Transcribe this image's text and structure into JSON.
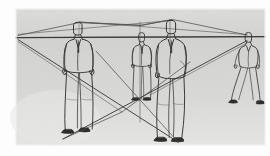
{
  "figure": {
    "type": "perspective-construction-sketch",
    "medium": "pencil line drawing on gray ground",
    "canvas": {
      "width": 270,
      "height": 156
    },
    "colors": {
      "page_background": "#fdfdfd",
      "ground_plane": "#d6d6d4",
      "ground_plane_light": "#e3e3e1",
      "ink": "#3b3b3b",
      "ink_light": "#6a6a6a",
      "shoe_fill": "#2e2e2e"
    },
    "plate": {
      "x": 16,
      "y": 9,
      "width": 249,
      "height": 136
    }
  },
  "horizon": {
    "label": "horizon line / eye level",
    "y": 37,
    "x_start": 16,
    "x_end": 265
  },
  "vanishing_points": [
    {
      "name": "left-vanishing-point",
      "x": 18,
      "y": 37
    },
    {
      "name": "right-vanishing-point",
      "x": 247,
      "y": 38
    }
  ],
  "crossing_point": {
    "name": "ground-diagonal-crossing",
    "x": 122,
    "y": 112
  },
  "construction_lines": [
    {
      "name": "horizon-line",
      "from": [
        16,
        37
      ],
      "to": [
        265,
        37
      ]
    },
    {
      "name": "head-line-to-left-vp",
      "from": [
        18,
        34
      ],
      "to": [
        200,
        20
      ]
    },
    {
      "name": "head-line-to-right-vp",
      "from": [
        247,
        35
      ],
      "to": [
        70,
        22
      ]
    },
    {
      "name": "ground-line-left-vp-to-right-foot",
      "from": [
        18,
        40
      ],
      "to": [
        175,
        140
      ]
    },
    {
      "name": "ground-line-right-vp-to-left-foot",
      "from": [
        247,
        41
      ],
      "to": [
        66,
        138
      ]
    },
    {
      "name": "vertical-measuring-line-mid",
      "from": [
        140,
        22
      ],
      "to": [
        140,
        122
      ]
    },
    {
      "name": "vertical-measuring-line-right",
      "from": [
        170,
        19
      ],
      "to": [
        170,
        40
      ]
    }
  ],
  "figures": [
    {
      "name": "figure-foreground-left",
      "pose": "standing frontal, hands at sides, business suit",
      "ground_x": 80,
      "head_top_y": 24,
      "feet_y": 132,
      "height_px": 108,
      "depth_rank": 1
    },
    {
      "name": "figure-middle-back",
      "pose": "standing frontal, arms down, smaller and further back",
      "ground_x": 142,
      "head_top_y": 33,
      "feet_y": 99,
      "height_px": 66,
      "depth_rank": 3
    },
    {
      "name": "figure-foreground-right",
      "pose": "standing three-quarter / side view, hand in pocket",
      "ground_x": 173,
      "head_top_y": 22,
      "feet_y": 140,
      "height_px": 118,
      "depth_rank": 1
    },
    {
      "name": "figure-walking-right",
      "pose": "walking to the right, legs striding, arms swinging",
      "ground_x": 249,
      "head_top_y": 33,
      "feet_y": 103,
      "height_px": 70,
      "depth_rank": 2
    }
  ],
  "annotations": {
    "caption": "",
    "notes": "Figure heights diminish toward the horizon; all head tops and foot points align on lines converging to the two vanishing points."
  }
}
